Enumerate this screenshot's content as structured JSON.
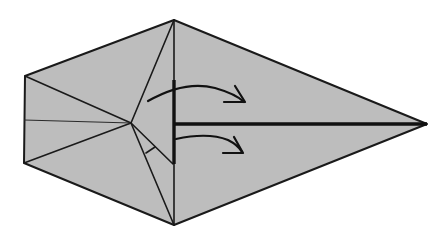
{
  "diagram": {
    "colors": {
      "paper_fill": "#bdbdbd",
      "line": "#1a1a1a",
      "background": "#ffffff"
    },
    "shape": {
      "outline_points": [
        [
          25,
          76
        ],
        [
          174,
          20
        ],
        [
          427,
          124
        ],
        [
          174,
          225
        ],
        [
          24,
          163
        ]
      ],
      "center_point": [
        131,
        123
      ]
    },
    "creases": [
      {
        "name": "left-top-to-center",
        "from": [
          25,
          76
        ],
        "to": [
          131,
          123
        ]
      },
      {
        "name": "left-bottom-to-center",
        "from": [
          24,
          163
        ],
        "to": [
          131,
          123
        ]
      },
      {
        "name": "left-mid-to-center",
        "from": [
          24,
          119
        ],
        "to": [
          131,
          123
        ],
        "style": "thin"
      },
      {
        "name": "top-to-center",
        "from": [
          174,
          20
        ],
        "to": [
          131,
          123
        ]
      },
      {
        "name": "center-to-bottom",
        "from": [
          131,
          123
        ],
        "to": [
          174,
          225
        ]
      },
      {
        "name": "center-to-flap-edge",
        "from": [
          131,
          123
        ],
        "to": [
          173,
          163
        ]
      },
      {
        "name": "vertical-top-to-bottom",
        "from": [
          174,
          20
        ],
        "to": [
          174,
          225
        ]
      }
    ],
    "bold_lines": [
      {
        "name": "raw-edge-vertical",
        "from": [
          174,
          80
        ],
        "to": [
          174,
          164
        ]
      },
      {
        "name": "center-line-horizontal",
        "from": [
          175,
          124
        ],
        "to": [
          427,
          124
        ]
      }
    ],
    "arrows": [
      {
        "name": "upper-fold-arrow",
        "direction": "right",
        "meaning": "fold flap over"
      },
      {
        "name": "lower-fold-arrow",
        "direction": "right",
        "meaning": "fold flap over"
      }
    ]
  }
}
